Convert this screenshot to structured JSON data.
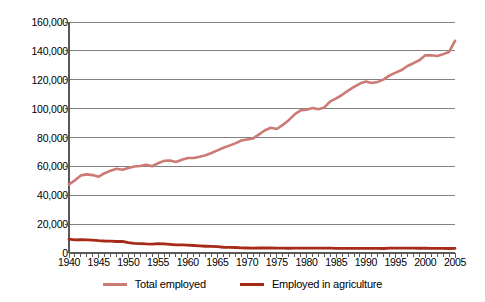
{
  "chart_data": {
    "type": "line",
    "title": "",
    "xlabel": "",
    "ylabel": "Number (in thousands)",
    "xlim": [
      1940,
      2005
    ],
    "ylim": [
      0,
      160000
    ],
    "grid": true,
    "legend_position": "bottom",
    "y_ticks": [
      "0",
      "20,000",
      "40,000",
      "60,000",
      "80,000",
      "100,000",
      "120,000",
      "140,000",
      "160,000"
    ],
    "y_tick_values": [
      0,
      20000,
      40000,
      60000,
      80000,
      100000,
      120000,
      140000,
      160000
    ],
    "x_ticks": [
      "1940",
      "1945",
      "1950",
      "1955",
      "1960",
      "1965",
      "1970",
      "1975",
      "1980",
      "1985",
      "1990",
      "1995",
      "2000",
      "2005"
    ],
    "x_tick_values": [
      1940,
      1945,
      1950,
      1955,
      1960,
      1965,
      1970,
      1975,
      1980,
      1985,
      1990,
      1995,
      2000,
      2005
    ],
    "x_minor_tick_interval": 1,
    "colors": {
      "total_employed": "#cc7a74",
      "employed_in_agriculture": "#a52a18",
      "gridline": "#808080",
      "axis": "#595959"
    },
    "x": [
      1940,
      1941,
      1942,
      1943,
      1944,
      1945,
      1946,
      1947,
      1948,
      1949,
      1950,
      1951,
      1952,
      1953,
      1954,
      1955,
      1956,
      1957,
      1958,
      1959,
      1960,
      1961,
      1962,
      1963,
      1964,
      1965,
      1966,
      1967,
      1968,
      1969,
      1970,
      1971,
      1972,
      1973,
      1974,
      1975,
      1976,
      1977,
      1978,
      1979,
      1980,
      1981,
      1982,
      1983,
      1984,
      1985,
      1986,
      1987,
      1988,
      1989,
      1990,
      1991,
      1992,
      1993,
      1994,
      1995,
      1996,
      1997,
      1998,
      1999,
      2000,
      2001,
      2002,
      2003,
      2004,
      2005
    ],
    "series": [
      {
        "name": "Total employed",
        "color": "#cc7a74",
        "values": [
          47520,
          50350,
          53750,
          54470,
          53960,
          52820,
          55250,
          57040,
          58340,
          57650,
          58920,
          59960,
          60250,
          61180,
          60110,
          62170,
          63800,
          64070,
          63040,
          64630,
          65780,
          65750,
          66700,
          67760,
          69300,
          71090,
          72900,
          74370,
          75920,
          77900,
          78680,
          79370,
          82150,
          85060,
          86790,
          85850,
          88750,
          92020,
          96050,
          98820,
          99300,
          100400,
          99530,
          100830,
          105000,
          107150,
          109600,
          112450,
          115000,
          117340,
          118790,
          117720,
          118490,
          120260,
          123060,
          124900,
          126710,
          129560,
          131460,
          133490,
          136900,
          136930,
          136490,
          137740,
          139250,
          147000
        ],
        "label_note": "Total civilian employment in thousands"
      },
      {
        "name": "Employed in agriculture",
        "color": "#a52a18",
        "values": [
          9540,
          9100,
          9250,
          9080,
          8950,
          8580,
          8320,
          8256,
          7960,
          8026,
          7160,
          6726,
          6500,
          6260,
          6205,
          6450,
          6283,
          5947,
          5586,
          5565,
          5458,
          5200,
          4944,
          4687,
          4523,
          4361,
          3979,
          3844,
          3817,
          3606,
          3463,
          3394,
          3484,
          3470,
          3515,
          3408,
          3331,
          3283,
          3387,
          3347,
          3364,
          3368,
          3401,
          3383,
          3321,
          3179,
          3163,
          3208,
          3169,
          3199,
          3223,
          3269,
          3247,
          3115,
          3409,
          3440,
          3443,
          3399,
          3378,
          3281,
          3305,
          3144,
          3250,
          3176,
          3111,
          3150
        ],
        "label_note": "Employment in agriculture in thousands"
      }
    ],
    "legend": [
      {
        "label": "Total employed",
        "color": "#cc7a74"
      },
      {
        "label": "Employed in agriculture",
        "color": "#a52a18"
      }
    ]
  }
}
